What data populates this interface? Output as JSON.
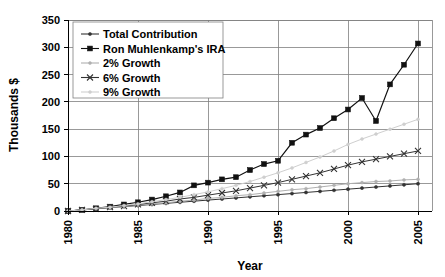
{
  "chart_data": {
    "type": "line",
    "title": "",
    "xlabel": "Year",
    "ylabel": "Thousands $",
    "xlim": [
      1980,
      2006
    ],
    "ylim": [
      0,
      350
    ],
    "ytick_step": 50,
    "yticks": [
      "0",
      "50",
      "100",
      "150",
      "200",
      "250",
      "300",
      "350"
    ],
    "xticks": [
      "1980",
      "1985",
      "1990",
      "1995",
      "2000",
      "2005"
    ],
    "grid": true,
    "legend_position": "upper-left-inside",
    "x": [
      1980,
      1981,
      1982,
      1983,
      1984,
      1985,
      1986,
      1987,
      1988,
      1989,
      1990,
      1991,
      1992,
      1993,
      1994,
      1995,
      1996,
      1997,
      1998,
      1999,
      2000,
      2001,
      2002,
      2003,
      2004,
      2005
    ],
    "series": [
      {
        "name": "Total Contribution",
        "marker": "dot",
        "color": "#333333",
        "values": [
          0,
          2,
          4,
          6,
          8,
          10,
          12,
          14,
          16,
          18,
          20,
          22,
          24,
          26,
          28,
          30,
          32,
          34,
          36,
          38,
          40,
          42,
          44,
          46,
          48,
          50
        ]
      },
      {
        "name": "Ron Muhlenkamp's IRA",
        "marker": "square",
        "color": "#111111",
        "values": [
          0,
          2,
          5,
          8,
          12,
          16,
          21,
          27,
          34,
          47,
          52,
          58,
          62,
          75,
          86,
          92,
          125,
          140,
          152,
          170,
          186,
          207,
          165,
          232,
          268,
          307
        ]
      },
      {
        "name": "2% Growth",
        "marker": "dot-light",
        "color": "#b0b0b0",
        "values": [
          0,
          2,
          4,
          6,
          8,
          11,
          13,
          15,
          18,
          20,
          23,
          25,
          28,
          30,
          33,
          36,
          39,
          41,
          44,
          47,
          50,
          52,
          54,
          55,
          57,
          58
        ]
      },
      {
        "name": "6% Growth",
        "marker": "x",
        "color": "#333333",
        "values": [
          0,
          2,
          4,
          7,
          9,
          12,
          15,
          18,
          22,
          25,
          29,
          33,
          37,
          42,
          47,
          52,
          58,
          64,
          70,
          77,
          84,
          90,
          95,
          100,
          105,
          110
        ]
      },
      {
        "name": "9% Growth",
        "marker": "dot-light",
        "color": "#cfcfcf",
        "values": [
          0,
          2,
          5,
          7,
          10,
          13,
          17,
          21,
          25,
          30,
          35,
          41,
          47,
          54,
          62,
          70,
          79,
          89,
          99,
          110,
          122,
          132,
          141,
          150,
          159,
          168
        ]
      }
    ]
  },
  "legend": {
    "items": [
      {
        "label": "Total Contribution"
      },
      {
        "label": "Ron Muhlenkamp's IRA"
      },
      {
        "label": "2% Growth"
      },
      {
        "label": "6% Growth"
      },
      {
        "label": "9% Growth"
      }
    ]
  },
  "axes": {
    "y_title": "Thousands $",
    "x_title": "Year"
  }
}
